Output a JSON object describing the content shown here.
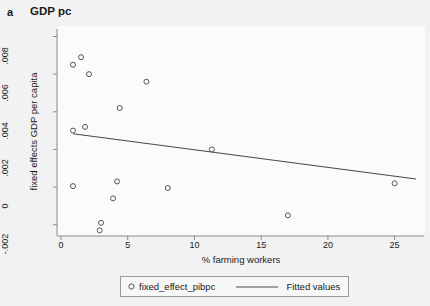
{
  "figure": {
    "panel_letter": "a",
    "title": "GDP pc",
    "background_color": "#f2f2f2",
    "plot_background_color": "#fbfbfb"
  },
  "chart_data": {
    "type": "scatter",
    "title": "GDP pc",
    "xlabel": "% farming workers",
    "ylabel": "fixed effects GDP per capita",
    "xlim": [
      -0.3,
      27.2
    ],
    "ylim": [
      -0.0026,
      0.0084
    ],
    "xticks": [
      0,
      5,
      10,
      15,
      20,
      25
    ],
    "xtick_labels": [
      "0",
      "5",
      "10",
      "15",
      "20",
      "25"
    ],
    "yticks": [
      -0.002,
      0,
      0.002,
      0.004,
      0.006,
      0.008
    ],
    "ytick_labels": [
      "-.002",
      "0",
      ".002",
      ".004",
      ".006",
      ".008"
    ],
    "grid": false,
    "legend_position": "bottom-center",
    "series": [
      {
        "name": "fixed_effect_pibpc",
        "type": "scatter",
        "marker": "open-circle",
        "color": "#555555",
        "points": [
          {
            "x": 0.9,
            "y": 0.0065
          },
          {
            "x": 1.5,
            "y": 0.0069
          },
          {
            "x": 2.1,
            "y": 0.006
          },
          {
            "x": 6.4,
            "y": 0.0056
          },
          {
            "x": 4.4,
            "y": 0.0042
          },
          {
            "x": 0.9,
            "y": 0.003
          },
          {
            "x": 1.8,
            "y": 0.0032
          },
          {
            "x": 11.3,
            "y": 0.002
          },
          {
            "x": 4.2,
            "y": 0.0003
          },
          {
            "x": 0.9,
            "y": 5e-05
          },
          {
            "x": 8.0,
            "y": -5e-05
          },
          {
            "x": 25.0,
            "y": 0.0002
          },
          {
            "x": 3.9,
            "y": -0.0006
          },
          {
            "x": 3.0,
            "y": -0.0019
          },
          {
            "x": 2.9,
            "y": -0.0023
          },
          {
            "x": 17.0,
            "y": -0.0015
          }
        ]
      },
      {
        "name": "Fitted values",
        "type": "line",
        "color": "#4a4a4a",
        "endpoints": [
          {
            "x": 0.9,
            "y": 0.00283
          },
          {
            "x": 26.6,
            "y": 0.00043
          }
        ]
      }
    ]
  },
  "legend": {
    "scatter_label": "fixed_effect_pibpc",
    "line_label": "Fitted values"
  }
}
